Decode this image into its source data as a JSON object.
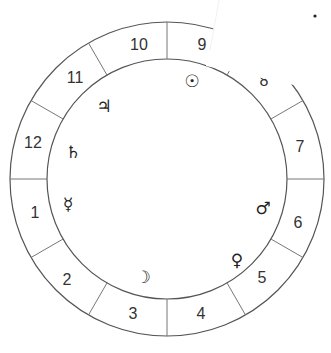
{
  "chart": {
    "type": "astrological-house-wheel",
    "center": [
      167,
      179
    ],
    "outer_radius": 157,
    "inner_radius": 120,
    "colors": {
      "ring": "#555555",
      "divider": "#777777",
      "text": "#333333",
      "background": "#ffffff"
    }
  },
  "houses": [
    {
      "number": "1",
      "x": 35,
      "y": 212
    },
    {
      "number": "2",
      "x": 67,
      "y": 279
    },
    {
      "number": "3",
      "x": 133,
      "y": 313
    },
    {
      "number": "4",
      "x": 201,
      "y": 313
    },
    {
      "number": "5",
      "x": 262,
      "y": 277
    },
    {
      "number": "6",
      "x": 298,
      "y": 222
    },
    {
      "number": "7",
      "x": 300,
      "y": 146
    },
    {
      "number": "8",
      "x": 264,
      "y": 80
    },
    {
      "number": "9",
      "x": 202,
      "y": 44
    },
    {
      "number": "10",
      "x": 139,
      "y": 44
    },
    {
      "number": "11",
      "x": 75,
      "y": 77
    },
    {
      "number": "12",
      "x": 33,
      "y": 142
    }
  ],
  "planets": [
    {
      "name": "Sun",
      "glyph": "☉",
      "x": 192,
      "y": 81
    },
    {
      "name": "Jupiter",
      "glyph": "♃",
      "x": 104,
      "y": 106
    },
    {
      "name": "Saturn",
      "glyph": "♄",
      "x": 73,
      "y": 152
    },
    {
      "name": "Mercury",
      "glyph": "☿",
      "x": 68,
      "y": 204
    },
    {
      "name": "Moon",
      "glyph": "☽",
      "x": 143,
      "y": 277
    },
    {
      "name": "Venus",
      "glyph": "♀",
      "x": 237,
      "y": 260
    },
    {
      "name": "Mars",
      "glyph": "♂",
      "x": 263,
      "y": 208
    }
  ],
  "overlay": {
    "description": "white wedge occluding upper-right portion of the ring (house 8 area)",
    "dot": {
      "x": 315,
      "y": 16
    }
  }
}
